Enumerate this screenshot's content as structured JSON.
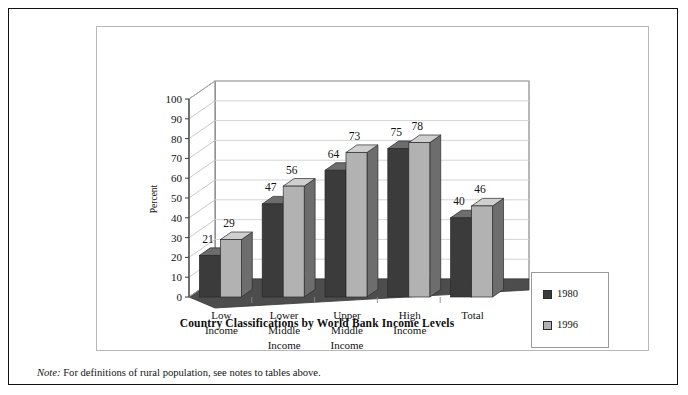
{
  "chart_data": {
    "type": "bar",
    "title": "",
    "xlabel": "Country Classifications by World Bank Income Levels",
    "ylabel": "Percent",
    "ylim": [
      0,
      100
    ],
    "yticks": [
      0,
      10,
      20,
      30,
      40,
      50,
      60,
      70,
      80,
      90,
      100
    ],
    "grid": true,
    "legend_position": "right-outside",
    "categories": [
      "Low Income",
      "Lower Middle Income",
      "Upper Middle Income",
      "High Income",
      "Total"
    ],
    "category_lines": [
      [
        "Low",
        "Income"
      ],
      [
        "Lower",
        "Middle",
        "Income"
      ],
      [
        "Upper",
        "Middle",
        "Income"
      ],
      [
        "High",
        "Income"
      ],
      [
        "Total"
      ]
    ],
    "series": [
      {
        "name": "1980",
        "color": "#3b3b3b",
        "values": [
          21,
          47,
          64,
          75,
          40
        ]
      },
      {
        "name": "1996",
        "color": "#b2b2b2",
        "values": [
          29,
          56,
          73,
          78,
          46
        ]
      }
    ]
  },
  "axis": {
    "y_title": "Percent",
    "tick_labels": [
      "100",
      "90",
      "80",
      "70",
      "60",
      "50",
      "40",
      "30",
      "20",
      "10",
      "0"
    ]
  },
  "legend": {
    "entries": [
      {
        "label": "1980",
        "swatch": "#3b3b3b"
      },
      {
        "label": "1996",
        "swatch": "#b2b2b2"
      }
    ]
  },
  "footer": {
    "x_axis_title": "Country Classifications by World Bank Income Levels",
    "note_label": "Note:",
    "note_text": " For definitions of rural population, see notes to tables above."
  },
  "colors": {
    "bar_1980_front": "#3b3b3b",
    "bar_1980_side": "#555555",
    "bar_1980_top": "#6d6d6d",
    "bar_1996_front": "#b2b2b2",
    "bar_1996_side": "#6d6d6d",
    "bar_1996_top": "#cfcfcf",
    "floor": "#4d4d4d",
    "gridline": "#cfcfcf",
    "frame": "#111111"
  }
}
